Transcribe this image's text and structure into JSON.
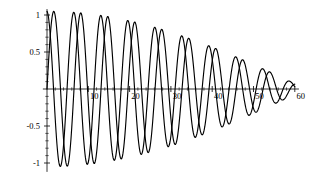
{
  "chart_data": {
    "type": "line",
    "title": "",
    "subtitle": "",
    "xlabel": "",
    "ylabel": "",
    "xlim": [
      -1,
      61
    ],
    "ylim": [
      -1.1,
      1.05
    ],
    "grid": false,
    "legend": "none",
    "background_color": "#ffffff",
    "line_color": "#000000",
    "axis_color": "#000000",
    "x_ticks": [
      10,
      20,
      30,
      40,
      50,
      60
    ],
    "x_tick_labels": [
      "10",
      "20",
      "30",
      "40",
      "50",
      "60"
    ],
    "x_minor_tick_step": 2,
    "y_ticks": [
      1,
      0.5,
      -0.5,
      -1
    ],
    "y_tick_labels": [
      "1",
      "0.5",
      "-0.5",
      "-1"
    ],
    "y_minor_tick_step": 0.1,
    "series": [
      {
        "name": "beat-wave-a",
        "formula": "0.525*(sin(0.9225*x) + sin(1.0*x))",
        "amplitude_envelope_period": 125.6,
        "carrier_period": 6.54,
        "x_start": 0,
        "x_end": 60,
        "samples": 600
      },
      {
        "name": "beat-wave-b",
        "formula": "0.525*(sin(0.9225*x + 1.62) + sin(1.0*x + 1.62))",
        "amplitude_envelope_period": 125.6,
        "carrier_period": 6.54,
        "phase_offset": 1.62,
        "x_start": 0,
        "x_end": 60,
        "samples": 600
      }
    ],
    "annotations": []
  },
  "figure": {
    "axis_origin_px": {
      "x": 47,
      "y": 89
    },
    "x_scale_px_per_unit": 4.13,
    "y_scale_px_per_unit": 74
  }
}
